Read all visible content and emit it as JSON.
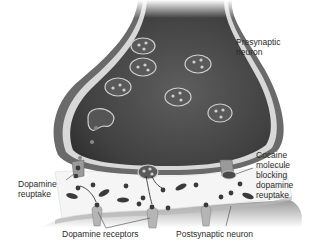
{
  "diagram": {
    "labels": {
      "presynaptic": "Presynaptic\nneuron",
      "cocaine": "Cocaine\nmolecule\nblocking\ndopamine\nreuptake",
      "reuptake": "Dopamine\nreuptake",
      "receptors": "Dopamine receptors",
      "postsynaptic": "Postsynaptic neuron"
    },
    "colors": {
      "neuron_dark": "#3a3a3a",
      "neuron_mid": "#5a5a5a",
      "membrane": "#d8d8d8",
      "cleft": "#f4f4f4",
      "vesicle": "#6a6a6a",
      "dopamine": "#2e2e2e",
      "text": "#2a2a2a"
    }
  }
}
